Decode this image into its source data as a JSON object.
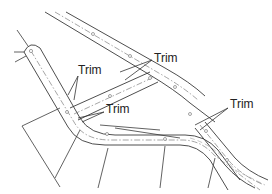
{
  "diagram": {
    "type": "road corridor intersection plan",
    "colors": {
      "line": "#3a3a3a",
      "centerline": "#6a6a6a",
      "background": "#ffffff"
    },
    "callouts": [
      {
        "id": "trim-left",
        "label": "Trim"
      },
      {
        "id": "trim-top",
        "label": "Trim"
      },
      {
        "id": "trim-middle",
        "label": "Trim"
      },
      {
        "id": "trim-right",
        "label": "Trim"
      }
    ]
  }
}
